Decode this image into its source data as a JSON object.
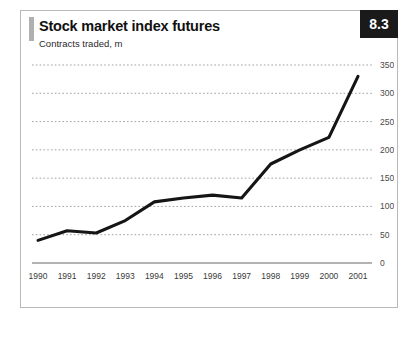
{
  "card": {
    "title": "Stock market index futures",
    "subtitle": "Contracts traded, m",
    "figure_number": "8.3",
    "accent_color": "#b0b0b0",
    "badge_bg": "#1a1a1a",
    "badge_fg": "#ffffff",
    "line_color": "#151515",
    "grid_color": "#8a8a8a",
    "border_color": "#b9b9b9"
  },
  "chart_data": {
    "type": "line",
    "title": "Stock market index futures",
    "subtitle": "Contracts traded, m",
    "xlabel": "",
    "ylabel": "Contracts traded, m",
    "categories": [
      "1990",
      "1991",
      "1992",
      "1993",
      "1994",
      "1995",
      "1996",
      "1997",
      "1998",
      "1999",
      "2000",
      "2001"
    ],
    "values": [
      40,
      57,
      53,
      75,
      108,
      115,
      120,
      115,
      175,
      200,
      222,
      330
    ],
    "series": [
      {
        "name": "Contracts traded, m",
        "values": [
          40,
          57,
          53,
          75,
          108,
          115,
          120,
          115,
          175,
          200,
          222,
          330
        ]
      }
    ],
    "ylim": [
      0,
      350
    ],
    "yticks": [
      0,
      50,
      100,
      150,
      200,
      250,
      300,
      350
    ],
    "ytick_labels": [
      "0",
      "50",
      "100",
      "150",
      "200",
      "250",
      "300",
      "350"
    ],
    "xtick_labels": [
      "1990",
      "1991",
      "1992",
      "1993",
      "1994",
      "1995",
      "1996",
      "1997",
      "1998",
      "1999",
      "2000",
      "2001"
    ],
    "grid": true,
    "grid_style": "dotted-horizontal",
    "legend": false,
    "legend_position": "none",
    "y_axis_side": "right"
  }
}
